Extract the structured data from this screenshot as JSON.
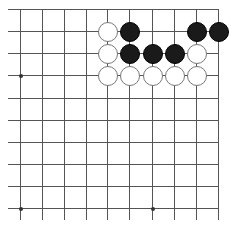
{
  "board": {
    "type": "go-board-fragment",
    "columns": 10,
    "rows": 10,
    "x_coords": [
      20,
      42,
      64,
      86,
      107,
      129,
      152,
      174,
      196,
      218
    ],
    "y_coords": [
      9,
      31,
      53,
      75,
      98,
      120,
      142,
      164,
      186,
      208
    ],
    "edges": {
      "top": true,
      "right": true,
      "left": false,
      "bottom": false
    },
    "line_color": "#555555",
    "star_points": [
      [
        0,
        3
      ],
      [
        0,
        9
      ],
      [
        6,
        9
      ]
    ],
    "stones": [
      {
        "color": "white",
        "col": 4,
        "row": 1
      },
      {
        "color": "black",
        "col": 5,
        "row": 1
      },
      {
        "color": "black",
        "col": 8,
        "row": 1
      },
      {
        "color": "black",
        "col": 9,
        "row": 1
      },
      {
        "color": "white",
        "col": 4,
        "row": 2
      },
      {
        "color": "black",
        "col": 5,
        "row": 2
      },
      {
        "color": "black",
        "col": 6,
        "row": 2
      },
      {
        "color": "black",
        "col": 7,
        "row": 2
      },
      {
        "color": "white",
        "col": 8,
        "row": 2
      },
      {
        "color": "white",
        "col": 4,
        "row": 3
      },
      {
        "color": "white",
        "col": 5,
        "row": 3
      },
      {
        "color": "white",
        "col": 6,
        "row": 3
      },
      {
        "color": "white",
        "col": 7,
        "row": 3
      },
      {
        "color": "white",
        "col": 8,
        "row": 3
      }
    ]
  }
}
